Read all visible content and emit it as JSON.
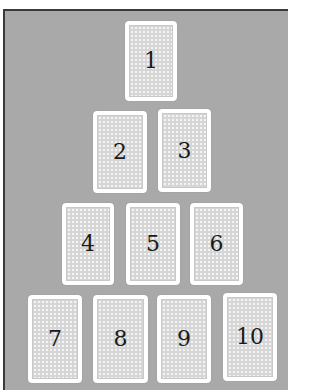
{
  "diagram": {
    "type": "card-spread",
    "colors": {
      "background_panel": "#a9a9a9",
      "card_border": "#ffffff",
      "card_pattern": "#d6d6d6",
      "number_text": "#1a1a1a"
    },
    "rows": [
      {
        "row": 1,
        "cards": [
          1
        ]
      },
      {
        "row": 2,
        "cards": [
          2,
          3
        ]
      },
      {
        "row": 3,
        "cards": [
          4,
          5,
          6
        ]
      },
      {
        "row": 4,
        "cards": [
          7,
          8,
          9,
          10
        ]
      }
    ],
    "cards": [
      {
        "label": "1",
        "x": 125,
        "y": 21,
        "w": 52,
        "h": 80
      },
      {
        "label": "2",
        "x": 93,
        "y": 111,
        "w": 54,
        "h": 82
      },
      {
        "label": "3",
        "x": 158,
        "y": 109,
        "w": 53,
        "h": 83
      },
      {
        "label": "4",
        "x": 62,
        "y": 203,
        "w": 52,
        "h": 82
      },
      {
        "label": "5",
        "x": 126,
        "y": 203,
        "w": 54,
        "h": 82
      },
      {
        "label": "6",
        "x": 190,
        "y": 203,
        "w": 53,
        "h": 82
      },
      {
        "label": "7",
        "x": 28,
        "y": 295,
        "w": 54,
        "h": 88
      },
      {
        "label": "8",
        "x": 93,
        "y": 295,
        "w": 55,
        "h": 88
      },
      {
        "label": "9",
        "x": 157,
        "y": 295,
        "w": 54,
        "h": 88
      },
      {
        "label": "10",
        "x": 223,
        "y": 293,
        "w": 54,
        "h": 88
      }
    ]
  }
}
